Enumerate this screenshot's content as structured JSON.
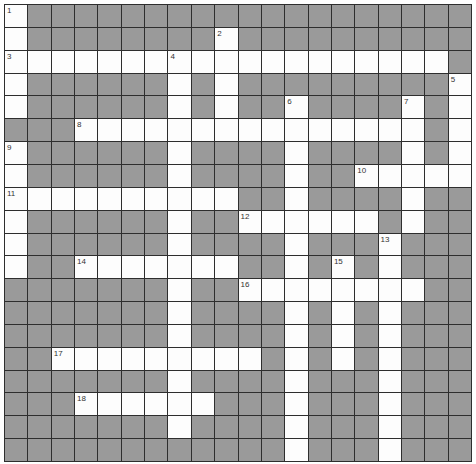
{
  "puzzle": {
    "rows": 20,
    "cols": 20,
    "colors": {
      "block": "#9a9a9a",
      "open": "#fdfdfd",
      "line": "#2e2e2e"
    },
    "legend": {
      "W": "open cell",
      "#": "block cell"
    },
    "grid": [
      "W###################",
      "W########W##########",
      "WWWWWWWWWWWWWWWWWWW#",
      "W######W#W#########W",
      "W######W#W##W####W#W",
      "###WWWWWWWWWWWWWWW#W",
      "W######W####W####W#W",
      "W######W####W##WWWWW",
      "WWWWWWWWWW##W####W##",
      "W######W##WWWWWW#W##",
      "W######W####W###W###",
      "W##WWWWWWW##W#W#W###",
      "#######W##WWWWWWWW##",
      "#######W####W#W#W###",
      "#######W####W#W#W###",
      "##WWWWWWWWW#W#W#W###",
      "#######W####W###W###",
      "###WWWWWW###W###W###",
      "#######W####W###W###",
      "############W###W###"
    ],
    "numbers": [
      {
        "row": 0,
        "col": 0,
        "label": "1"
      },
      {
        "row": 1,
        "col": 9,
        "label": "2"
      },
      {
        "row": 2,
        "col": 0,
        "label": "3"
      },
      {
        "row": 2,
        "col": 7,
        "label": "4"
      },
      {
        "row": 3,
        "col": 19,
        "label": "5"
      },
      {
        "row": 4,
        "col": 12,
        "label": "6"
      },
      {
        "row": 4,
        "col": 17,
        "label": "7"
      },
      {
        "row": 5,
        "col": 3,
        "label": "8"
      },
      {
        "row": 6,
        "col": 0,
        "label": "9"
      },
      {
        "row": 7,
        "col": 15,
        "label": "10"
      },
      {
        "row": 8,
        "col": 0,
        "label": "11"
      },
      {
        "row": 9,
        "col": 10,
        "label": "12"
      },
      {
        "row": 10,
        "col": 16,
        "label": "13"
      },
      {
        "row": 11,
        "col": 3,
        "label": "14"
      },
      {
        "row": 11,
        "col": 14,
        "label": "15"
      },
      {
        "row": 12,
        "col": 10,
        "label": "16"
      },
      {
        "row": 15,
        "col": 2,
        "label": "17"
      },
      {
        "row": 17,
        "col": 3,
        "label": "18"
      }
    ]
  }
}
